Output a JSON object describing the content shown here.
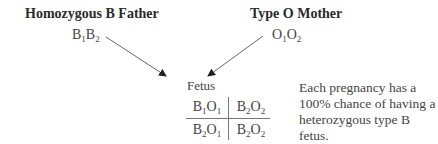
{
  "father": {
    "title": "Homozygous B Father",
    "genotype": [
      {
        "base": "B",
        "sub": "1"
      },
      {
        "base": "B",
        "sub": "2"
      }
    ]
  },
  "mother": {
    "title": "Type O Mother",
    "genotype": [
      {
        "base": "O",
        "sub": "1"
      },
      {
        "base": "O",
        "sub": "2"
      }
    ]
  },
  "offspring": {
    "label": "Fetus",
    "punnett": [
      [
        [
          {
            "base": "B",
            "sub": "1"
          },
          {
            "base": "O",
            "sub": "1"
          }
        ],
        [
          {
            "base": "B",
            "sub": "2"
          },
          {
            "base": "O",
            "sub": "2"
          }
        ]
      ],
      [
        [
          {
            "base": "B",
            "sub": "2"
          },
          {
            "base": "O",
            "sub": "1"
          }
        ],
        [
          {
            "base": "B",
            "sub": "2"
          },
          {
            "base": "O",
            "sub": "2"
          }
        ]
      ]
    ]
  },
  "note": "Each pregnancy has a 100% chance of having a heterozygous type B fetus."
}
